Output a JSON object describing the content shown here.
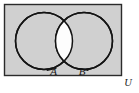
{
  "figure": {
    "type": "venn-diagram",
    "universe": {
      "label": "U",
      "shape": "rectangle",
      "fill_color": "#d0d0d0",
      "border_color": "#2b2b2b"
    },
    "sets": [
      {
        "id": "set-a",
        "label": "A",
        "position": "left",
        "center_x": 44,
        "center_y": 41,
        "radius": 29,
        "fill_color": "#d0d0d0",
        "stroke_color": "#1a1a1a"
      },
      {
        "id": "set-b",
        "label": "B",
        "position": "right",
        "center_x": 84,
        "center_y": 41,
        "radius": 29,
        "fill_color": "#d0d0d0",
        "stroke_color": "#1a1a1a"
      }
    ],
    "intersection": {
      "id": "intersection-region",
      "label": "",
      "shape": "lens",
      "fill_color": "#ffffff",
      "highlighted": true
    },
    "background_color": "#ffffff",
    "annotations": [
      {
        "id": "leader-a",
        "for": "A",
        "kind": "leader-line"
      },
      {
        "id": "leader-b",
        "for": "B",
        "kind": "leader-line"
      }
    ]
  }
}
